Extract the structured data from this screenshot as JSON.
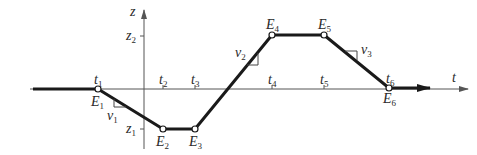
{
  "axes": {
    "horizontal_label": "t",
    "vertical_label": "z"
  },
  "z_levels": [
    {
      "name": "z",
      "sub": "1",
      "value_id": "z1"
    },
    {
      "name": "z",
      "sub": "2",
      "value_id": "z2"
    }
  ],
  "time_ticks": [
    {
      "name": "t",
      "sub": "1"
    },
    {
      "name": "t",
      "sub": "2"
    },
    {
      "name": "t",
      "sub": "3"
    },
    {
      "name": "t",
      "sub": "4"
    },
    {
      "name": "t",
      "sub": "5"
    },
    {
      "name": "t",
      "sub": "6"
    }
  ],
  "points": [
    {
      "name": "E",
      "sub": "1",
      "t": "t1",
      "z": "0"
    },
    {
      "name": "E",
      "sub": "2",
      "t": "t2",
      "z": "z1"
    },
    {
      "name": "E",
      "sub": "3",
      "t": "t3",
      "z": "z1"
    },
    {
      "name": "E",
      "sub": "4",
      "t": "t4",
      "z": "z2"
    },
    {
      "name": "E",
      "sub": "5",
      "t": "t5",
      "z": "z2"
    },
    {
      "name": "E",
      "sub": "6",
      "t": "t6",
      "z": "0"
    }
  ],
  "slopes": [
    {
      "name": "v",
      "sub": "1",
      "segment": "E1-E2"
    },
    {
      "name": "v",
      "sub": "2",
      "segment": "E3-E4"
    },
    {
      "name": "v",
      "sub": "3",
      "segment": "E5-E6"
    }
  ]
}
